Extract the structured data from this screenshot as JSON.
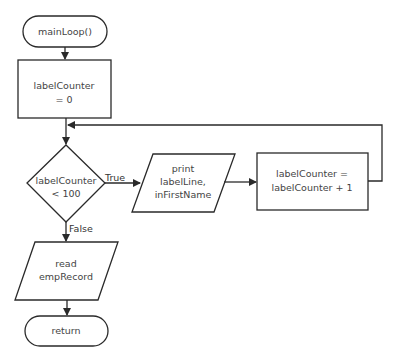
{
  "flowchart": {
    "nodes": {
      "start": {
        "type": "terminal",
        "lines": [
          "mainLoop()"
        ]
      },
      "init": {
        "type": "process",
        "lines": [
          "labelCounter",
          "= 0"
        ]
      },
      "decision": {
        "type": "decision",
        "lines": [
          "labelCounter",
          "< 100"
        ]
      },
      "print": {
        "type": "io",
        "lines": [
          "print",
          "labelLine,",
          "inFirstName"
        ]
      },
      "increment": {
        "type": "process",
        "lines": [
          "labelCounter =",
          "labelCounter + 1"
        ]
      },
      "read": {
        "type": "io",
        "lines": [
          "read",
          "empRecord"
        ]
      },
      "end": {
        "type": "terminal",
        "lines": [
          "return"
        ]
      }
    },
    "edges": {
      "true_label": "True",
      "false_label": "False"
    },
    "colors": {
      "stroke": "#2a2a2a",
      "text": "#444444",
      "background": "#ffffff"
    }
  }
}
